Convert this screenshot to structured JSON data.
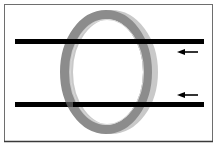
{
  "diagram": {
    "colors": {
      "background": "#ffffff",
      "frame": "#6e6e6e",
      "bar": "#000000",
      "ring_face": "#8c8c8c",
      "ring_rim": "#c9c9c9",
      "arrow": "#000000"
    },
    "bars": [
      {
        "id": "top-bar",
        "y": 41.5,
        "x1": 15,
        "x2": 204,
        "thickness": 5
      },
      {
        "id": "bottom-bar",
        "y": 104.5,
        "x1": 15,
        "x2": 204,
        "thickness": 5
      }
    ],
    "ring": {
      "cx": 106,
      "cy": 72,
      "rx": 46,
      "ry": 62,
      "band": 9,
      "rim_offset": 5
    },
    "arrows": [
      {
        "id": "top-arrow",
        "y": 52,
        "x_tail": 198,
        "x_head": 177,
        "direction": "left"
      },
      {
        "id": "bottom-arrow",
        "y": 95,
        "x_tail": 198,
        "x_head": 177,
        "direction": "left"
      }
    ]
  }
}
